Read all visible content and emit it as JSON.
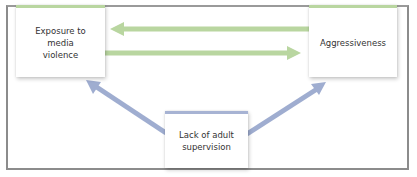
{
  "diagram": {
    "type": "causal-relationship",
    "nodes": [
      {
        "id": "exposure",
        "label": "Exposure to media violence",
        "lines": [
          "Exposure to",
          "media",
          "violence"
        ],
        "accent": "#b9d6a0"
      },
      {
        "id": "aggressiveness",
        "label": "Aggressiveness",
        "lines": [
          "Aggressiveness"
        ],
        "accent": "#b9d6a0"
      },
      {
        "id": "supervision",
        "label": "Lack of adult supervision",
        "lines": [
          "Lack of adult",
          "supervision"
        ],
        "accent": "#a7b3d3"
      }
    ],
    "edges": [
      {
        "from": "aggressiveness",
        "to": "exposure",
        "color": "#b9d6a0"
      },
      {
        "from": "exposure",
        "to": "aggressiveness",
        "color": "#b9d6a0"
      },
      {
        "from": "supervision",
        "to": "exposure",
        "color": "#9fadd0"
      },
      {
        "from": "supervision",
        "to": "aggressiveness",
        "color": "#9fadd0"
      }
    ]
  },
  "colors": {
    "green_arrow": "#b9d6a0",
    "blue_arrow": "#9fadd0",
    "frame": "#8c8c8c",
    "text": "#333333"
  }
}
